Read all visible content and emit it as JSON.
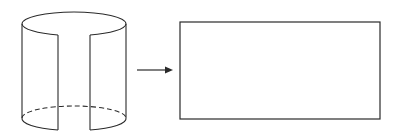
{
  "diagram": {
    "stroke_color": "#2a2a2a",
    "background": "#ffffff",
    "elements": [
      {
        "id": "cylinder",
        "kind": "open-cylinder-with-slit",
        "label": ""
      },
      {
        "id": "arrow",
        "kind": "arrow-right",
        "label": ""
      },
      {
        "id": "rectangle",
        "kind": "unrolled-rectangle",
        "label": ""
      }
    ]
  }
}
